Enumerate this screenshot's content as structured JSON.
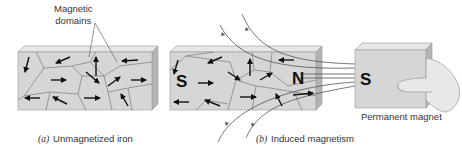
{
  "labels": {
    "domains_line1": "Magnetic",
    "domains_line2": "domains",
    "permanent_magnet": "Permanent magnet"
  },
  "captions": {
    "a_marker": "(a)",
    "a_text": "Unmagnetized iron",
    "b_marker": "(b)",
    "b_text": "Induced magnetism"
  },
  "poles": {
    "iron_left": "S",
    "iron_right": "N",
    "magnet_face": "S"
  },
  "colors": {
    "block_front": "#d6d6d6",
    "block_top": "#e6e6e6",
    "block_side": "#b4b4b4",
    "domain_wall": "#7a7a7a",
    "arrow": "#111111",
    "field_line": "#555555",
    "skin": "#e8e8e8"
  }
}
